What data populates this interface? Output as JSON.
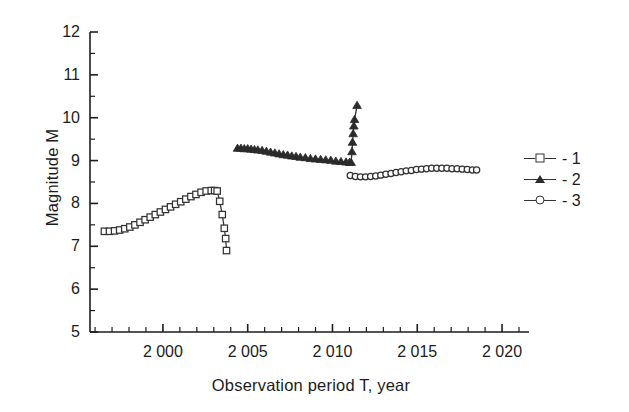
{
  "chart_data": {
    "type": "line",
    "title": "",
    "xlabel": "Observation period T, year",
    "ylabel": "Magnitude M",
    "xlim": [
      1995.7,
      2021.0
    ],
    "ylim": [
      5,
      12
    ],
    "grid": false,
    "legend_position": "right",
    "x_ticks": [
      2000,
      2005,
      2010,
      2015,
      2020
    ],
    "x_tick_labels": [
      "2 000",
      "2 005",
      "2 010",
      "2 015",
      "2 020"
    ],
    "x_minor_tick_step": 1,
    "y_ticks": [
      5,
      6,
      7,
      8,
      9,
      10,
      11,
      12
    ],
    "y_tick_labels": [
      "5",
      "6",
      "7",
      "8",
      "9",
      "10",
      "11",
      "12"
    ],
    "y_minor_tick_step": 0.5,
    "series": [
      {
        "name": "- 1",
        "marker": "open-square",
        "color": "#333333",
        "points": [
          [
            1996.55,
            7.35
          ],
          [
            1996.85,
            7.35
          ],
          [
            1997.15,
            7.36
          ],
          [
            1997.45,
            7.38
          ],
          [
            1997.75,
            7.41
          ],
          [
            1998.05,
            7.45
          ],
          [
            1998.35,
            7.5
          ],
          [
            1998.65,
            7.56
          ],
          [
            1998.95,
            7.62
          ],
          [
            1999.25,
            7.68
          ],
          [
            1999.55,
            7.74
          ],
          [
            1999.85,
            7.8
          ],
          [
            2000.15,
            7.86
          ],
          [
            2000.45,
            7.92
          ],
          [
            2000.75,
            7.98
          ],
          [
            2001.05,
            8.04
          ],
          [
            2001.35,
            8.1
          ],
          [
            2001.65,
            8.16
          ],
          [
            2001.95,
            8.21
          ],
          [
            2002.25,
            8.26
          ],
          [
            2002.55,
            8.29
          ],
          [
            2002.85,
            8.3
          ],
          [
            2003.05,
            8.3
          ],
          [
            2003.2,
            8.29
          ],
          [
            2003.35,
            8.05
          ],
          [
            2003.5,
            7.74
          ],
          [
            2003.62,
            7.42
          ],
          [
            2003.7,
            7.18
          ],
          [
            2003.75,
            6.9
          ]
        ]
      },
      {
        "name": "- 2",
        "marker": "filled-triangle",
        "color": "#2b2b2b",
        "points": [
          [
            2004.4,
            9.28
          ],
          [
            2004.6,
            9.28
          ],
          [
            2004.8,
            9.27
          ],
          [
            2005.0,
            9.27
          ],
          [
            2005.2,
            9.26
          ],
          [
            2005.4,
            9.25
          ],
          [
            2005.6,
            9.24
          ],
          [
            2005.85,
            9.23
          ],
          [
            2006.1,
            9.21
          ],
          [
            2006.35,
            9.19
          ],
          [
            2006.6,
            9.17
          ],
          [
            2006.85,
            9.15
          ],
          [
            2007.1,
            9.13
          ],
          [
            2007.35,
            9.12
          ],
          [
            2007.6,
            9.1
          ],
          [
            2007.85,
            9.09
          ],
          [
            2008.1,
            9.07
          ],
          [
            2008.4,
            9.06
          ],
          [
            2008.7,
            9.04
          ],
          [
            2009.0,
            9.03
          ],
          [
            2009.3,
            9.02
          ],
          [
            2009.6,
            9.01
          ],
          [
            2009.9,
            9.0
          ],
          [
            2010.2,
            8.98
          ],
          [
            2010.5,
            8.97
          ],
          [
            2010.8,
            8.96
          ],
          [
            2011.0,
            8.95
          ],
          [
            2011.1,
            8.95
          ],
          [
            2011.15,
            9.2
          ],
          [
            2011.18,
            9.42
          ],
          [
            2011.22,
            9.62
          ],
          [
            2011.26,
            9.8
          ],
          [
            2011.3,
            9.95
          ],
          [
            2011.45,
            10.28
          ]
        ]
      },
      {
        "name": "- 3",
        "marker": "open-circle",
        "color": "#333333",
        "points": [
          [
            2011.05,
            8.65
          ],
          [
            2011.35,
            8.63
          ],
          [
            2011.65,
            8.62
          ],
          [
            2011.95,
            8.62
          ],
          [
            2012.25,
            8.63
          ],
          [
            2012.55,
            8.64
          ],
          [
            2012.85,
            8.66
          ],
          [
            2013.15,
            8.68
          ],
          [
            2013.45,
            8.7
          ],
          [
            2013.75,
            8.72
          ],
          [
            2014.05,
            8.74
          ],
          [
            2014.35,
            8.76
          ],
          [
            2014.65,
            8.77
          ],
          [
            2014.95,
            8.79
          ],
          [
            2015.25,
            8.8
          ],
          [
            2015.55,
            8.81
          ],
          [
            2015.85,
            8.82
          ],
          [
            2016.15,
            8.82
          ],
          [
            2016.45,
            8.82
          ],
          [
            2016.75,
            8.82
          ],
          [
            2017.05,
            8.81
          ],
          [
            2017.35,
            8.81
          ],
          [
            2017.65,
            8.8
          ],
          [
            2017.95,
            8.79
          ],
          [
            2018.25,
            8.78
          ],
          [
            2018.5,
            8.78
          ]
        ]
      }
    ]
  },
  "legend": {
    "entries": [
      {
        "label": "- 1",
        "marker": "open-square"
      },
      {
        "label": "- 2",
        "marker": "filled-triangle"
      },
      {
        "label": "- 3",
        "marker": "open-circle"
      }
    ]
  }
}
